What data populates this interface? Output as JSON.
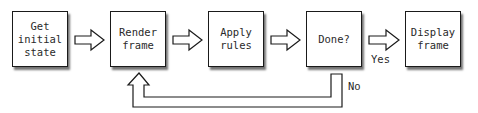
{
  "diagram": {
    "nodes": [
      {
        "id": "get-initial-state",
        "label": "Get\ninitial\nstate"
      },
      {
        "id": "render-frame",
        "label": "Render\nframe"
      },
      {
        "id": "apply-rules",
        "label": "Apply\nrules"
      },
      {
        "id": "done",
        "label": "Done?"
      },
      {
        "id": "display-frame",
        "label": "Display\nframe"
      }
    ],
    "edges": [
      {
        "from": "get-initial-state",
        "to": "render-frame",
        "label": ""
      },
      {
        "from": "render-frame",
        "to": "apply-rules",
        "label": ""
      },
      {
        "from": "apply-rules",
        "to": "done",
        "label": ""
      },
      {
        "from": "done",
        "to": "display-frame",
        "label": "Yes"
      },
      {
        "from": "done",
        "to": "render-frame",
        "label": "No"
      }
    ],
    "edge_labels": {
      "yes": "Yes",
      "no": "No"
    },
    "colors": {
      "stroke": "#1a1a1a",
      "text": "#2a2a2a",
      "background": "#ffffff"
    }
  }
}
